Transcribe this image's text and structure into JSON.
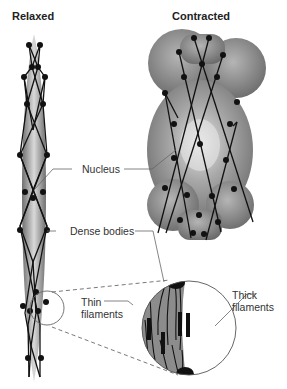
{
  "titles": {
    "relaxed": "Relaxed",
    "contracted": "Contracted"
  },
  "labels": {
    "nucleus": "Nucleus",
    "dense_bodies": "Dense bodies",
    "thin_filaments_line1": "Thin",
    "thin_filaments_line2": "filaments",
    "thick_filaments_line1": "Thick",
    "thick_filaments_line2": "filaments"
  },
  "colors": {
    "cell_fill": "#8a8a8a",
    "cell_highlight": "#d8d8d8",
    "filament": "#111111",
    "dense_body": "#111111",
    "leader_line": "#555555"
  }
}
